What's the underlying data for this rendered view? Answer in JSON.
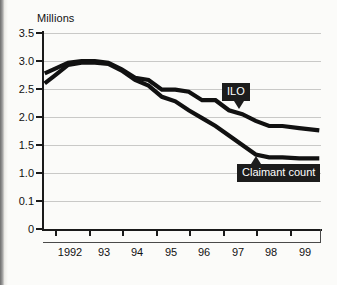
{
  "chart_data": {
    "type": "line",
    "title": "",
    "ylabel": "Millions",
    "xlabel": "",
    "ylim": [
      0,
      3.5
    ],
    "xlim": [
      1991.6,
      1999.9
    ],
    "grid": true,
    "legend_position": "inline-callout",
    "y_ticks": [
      "3.5",
      "3.0",
      "2.5",
      "2.0",
      "1.5",
      "1.0",
      "0.1",
      "0"
    ],
    "y_tick_values": [
      3.5,
      3.0,
      2.5,
      2.0,
      1.5,
      1.0,
      0.5,
      0.0
    ],
    "x_ticks": [
      "1992",
      "93",
      "94",
      "95",
      "96",
      "97",
      "98",
      "99"
    ],
    "x_tick_values": [
      1992,
      1993,
      1994,
      1995,
      1996,
      1997,
      1998,
      1999
    ],
    "series": [
      {
        "name": "ILO",
        "color": "#111111",
        "x": [
          1991.65,
          1991.95,
          1992.35,
          1992.75,
          1993.15,
          1993.55,
          1993.95,
          1994.35,
          1994.75,
          1995.15,
          1995.55,
          1995.95,
          1996.35,
          1996.75,
          1997.15,
          1997.55,
          1997.95,
          1998.35,
          1998.75,
          1999.25,
          1999.85
        ],
        "values": [
          2.78,
          2.86,
          2.97,
          3.0,
          3.0,
          2.97,
          2.85,
          2.7,
          2.66,
          2.49,
          2.49,
          2.45,
          2.3,
          2.3,
          2.12,
          2.05,
          1.93,
          1.84,
          1.84,
          1.8,
          1.76
        ]
      },
      {
        "name": "Claimant count",
        "color": "#111111",
        "x": [
          1991.65,
          1991.95,
          1992.35,
          1992.75,
          1993.15,
          1993.55,
          1993.95,
          1994.35,
          1994.75,
          1995.15,
          1995.55,
          1995.95,
          1996.35,
          1996.75,
          1997.15,
          1997.55,
          1997.95,
          1998.35,
          1998.75,
          1999.25,
          1999.85
        ],
        "values": [
          2.6,
          2.74,
          2.93,
          2.97,
          2.97,
          2.95,
          2.83,
          2.66,
          2.56,
          2.36,
          2.28,
          2.12,
          1.98,
          1.84,
          1.67,
          1.5,
          1.33,
          1.28,
          1.28,
          1.26,
          1.26
        ]
      }
    ],
    "annotations": [
      {
        "name": "ILO",
        "text": "ILO",
        "pointer": "down",
        "x": 1997.3,
        "y": 2.12
      },
      {
        "name": "Claimant count",
        "text": "Claimant count",
        "pointer": "up",
        "x": 1997.8,
        "y": 1.33
      }
    ]
  }
}
